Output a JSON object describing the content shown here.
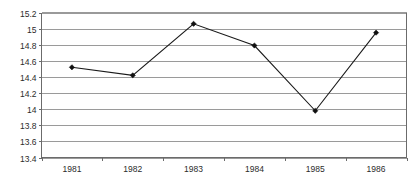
{
  "chart_data": {
    "type": "line",
    "title": "",
    "subtitle": "",
    "xlabel": "",
    "ylabel": "",
    "categories": [
      "1981",
      "1982",
      "1983",
      "1984",
      "1985",
      "1986"
    ],
    "x": [
      1981,
      1982,
      1983,
      1984,
      1985,
      1986
    ],
    "values": [
      14.52,
      14.42,
      15.06,
      14.79,
      13.98,
      14.95
    ],
    "series": [
      {
        "name": "",
        "values": [
          14.52,
          14.42,
          15.06,
          14.79,
          13.98,
          14.95
        ]
      }
    ],
    "ylim": [
      13.4,
      15.2
    ],
    "ytick_step": 0.2,
    "ytick_labels": [
      "15.2",
      "15",
      "14.8",
      "14.6",
      "14.4",
      "14.2",
      "14",
      "13.8",
      "13.6",
      "13.4"
    ],
    "ytick_values": [
      15.2,
      15,
      14.8,
      14.6,
      14.4,
      14.2,
      14,
      13.8,
      13.6,
      13.4
    ],
    "xtick_labels": [
      "1981",
      "1982",
      "1983",
      "1984",
      "1985",
      "1986"
    ],
    "grid": true,
    "grid_axis": "y",
    "legend": false,
    "legend_position": "none",
    "marker": "diamond",
    "colors": {
      "line": "#1a1a1a",
      "marker": "#101010",
      "grid": "#9a9a9a",
      "axis": "#6b6b6b",
      "plot_border": "#8d8d8d",
      "background": "#ffffff",
      "tick_text": "#2b2b2b"
    }
  },
  "axes": {
    "y": {
      "ticks": [
        {
          "label": "15.2",
          "value": 15.2
        },
        {
          "label": "15",
          "value": 15
        },
        {
          "label": "14.8",
          "value": 14.8
        },
        {
          "label": "14.6",
          "value": 14.6
        },
        {
          "label": "14.4",
          "value": 14.4
        },
        {
          "label": "14.2",
          "value": 14.2
        },
        {
          "label": "14",
          "value": 14
        },
        {
          "label": "13.8",
          "value": 13.8
        },
        {
          "label": "13.6",
          "value": 13.6
        },
        {
          "label": "13.4",
          "value": 13.4
        }
      ]
    },
    "x": {
      "ticks": [
        {
          "label": "1981"
        },
        {
          "label": "1982"
        },
        {
          "label": "1983"
        },
        {
          "label": "1984"
        },
        {
          "label": "1985"
        },
        {
          "label": "1986"
        }
      ]
    }
  }
}
